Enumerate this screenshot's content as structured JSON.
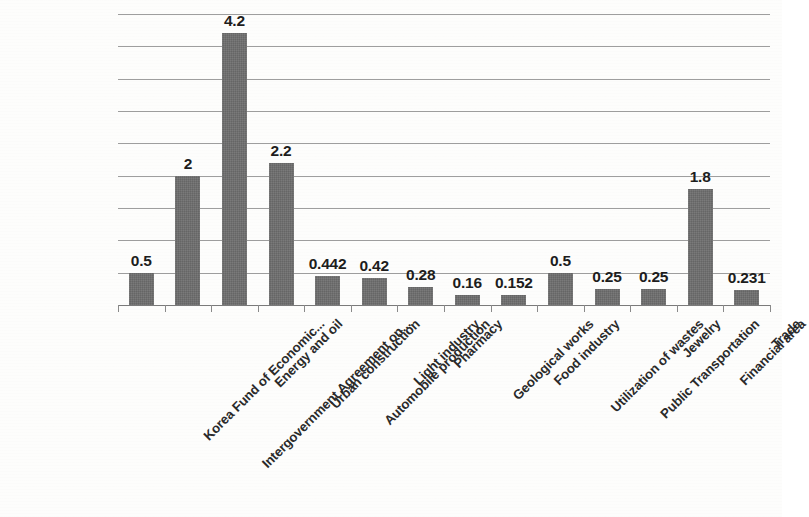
{
  "chart_data": {
    "type": "bar",
    "title": "",
    "subtitle": "",
    "xlabel": "",
    "ylabel": "",
    "ylim": [
      0,
      4.5
    ],
    "grid": true,
    "gridline_step": 0.5,
    "gridline_values": [
      0.5,
      1.0,
      1.5,
      2.0,
      2.5,
      3.0,
      3.5,
      4.0,
      4.5
    ],
    "legend": "none",
    "bar_color": "#6d6d6d",
    "label_rotation_degrees": -45,
    "categories": [
      "Korea Fund of Economic...",
      "Intergovernment Agreement on...",
      "Energy and oil",
      "Urban construction",
      "Automobile production",
      "Light industry",
      "Pharmacy",
      "Geological works",
      "Food industry",
      "Utilization of wastes",
      "Public Transportation",
      "Jewelry",
      "Financial area",
      "Trade"
    ],
    "values": [
      0.5,
      2,
      4.2,
      2.2,
      0.442,
      0.42,
      0.28,
      0.16,
      0.152,
      0.5,
      0.25,
      0.25,
      1.8,
      0.231
    ],
    "value_labels": [
      "0.5",
      "2",
      "4.2",
      "2.2",
      "0.442",
      "0.42",
      "0.28",
      "0.16",
      "0.152",
      "0.5",
      "0.25",
      "0.25",
      "1.8",
      "0.231"
    ]
  }
}
